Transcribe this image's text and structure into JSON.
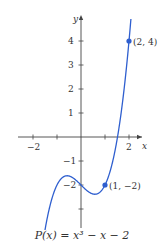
{
  "chart_data": {
    "type": "line",
    "title": "",
    "caption": "P(x) = x³ − x − 2",
    "function": "P(x) = x^3 - x - 2",
    "xlabel": "x",
    "ylabel": "y",
    "xlim": [
      -2.5,
      2.6
    ],
    "ylim": [
      -3.7,
      5.0
    ],
    "x_ticks": [
      -2,
      -1,
      1,
      2
    ],
    "x_tick_labels": [
      "−2",
      "2"
    ],
    "y_ticks": [
      -3,
      -2,
      -1,
      1,
      2,
      3,
      4
    ],
    "y_tick_labels": [
      "−2",
      "−1",
      "1",
      "2",
      "3",
      "4"
    ],
    "grid": false,
    "legend": null,
    "series": [
      {
        "name": "P(x)",
        "color": "#2f5fcf",
        "x": [
          -1.5,
          -1.25,
          -1.0,
          -0.75,
          -0.577,
          -0.5,
          -0.25,
          0,
          0.25,
          0.5,
          0.577,
          0.75,
          1.0,
          1.25,
          1.5,
          1.75,
          2.0,
          2.08
        ],
        "y": [
          -3.875,
          -3.703,
          -2.0,
          -1.672,
          -1.615,
          -1.625,
          -1.766,
          -2.0,
          -2.234,
          -2.375,
          -2.385,
          -2.328,
          -2.0,
          -1.297,
          -0.125,
          1.609,
          4.0,
          5.0
        ]
      }
    ],
    "points": [
      {
        "x": 2,
        "y": 4,
        "label": "(2, 4)"
      },
      {
        "x": 1,
        "y": -2,
        "label": "(1, −2)"
      }
    ]
  },
  "labels": {
    "x_axis": "x",
    "y_axis": "y",
    "xtick_neg2": "−2",
    "xtick_2": "2",
    "ytick_4": "4",
    "ytick_3": "3",
    "ytick_2": "2",
    "ytick_1": "1",
    "ytick_neg1": "−1",
    "ytick_neg2": "−2",
    "point_a": "(2, 4)",
    "point_b": "(1, −2)",
    "caption": "P(x) = x³ − x − 2"
  },
  "colors": {
    "curve": "#2f5fcf",
    "axis": "#444444",
    "text": "#333333"
  }
}
